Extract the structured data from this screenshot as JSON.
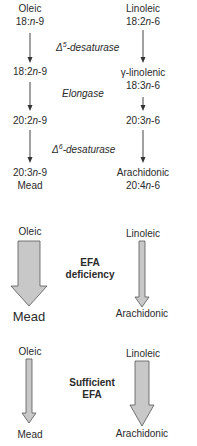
{
  "pathway": {
    "left": {
      "start_name": "Oleic",
      "start_formula_a": "18:",
      "start_formula_n": "n",
      "start_formula_b": "-9",
      "mid1_a": "18:2",
      "mid1_n": "n",
      "mid1_b": "-9",
      "mid2_a": "20:2",
      "mid2_n": "n",
      "mid2_b": "-9",
      "end_formula_a": "20:3",
      "end_formula_n": "n",
      "end_formula_b": "-9",
      "end_name": "Mead"
    },
    "right": {
      "start_name": "Linoleic",
      "start_formula_a": "18:2",
      "start_formula_n": "n",
      "start_formula_b": "-6",
      "mid1_name": "γ-linolenic",
      "mid1_a": "18:3",
      "mid1_n": "n",
      "mid1_b": "-6",
      "mid2_a": "20:3",
      "mid2_n": "n",
      "mid2_b": "-6",
      "end_name": "Arachidonic",
      "end_formula_a": "20:4",
      "end_formula_n": "n",
      "end_formula_b": "-6"
    },
    "enzymes": {
      "step1_delta": "Δ",
      "step1_sup": "5",
      "step1_text": "-desaturase",
      "step2": "Elongase",
      "step3_delta": "Δ",
      "step3_sup": "6",
      "step3_text": "-desaturase"
    }
  },
  "efa_deficiency": {
    "label_line1": "EFA",
    "label_line2": "deficiency",
    "left_start": "Oleic",
    "left_end": "Mead",
    "right_start": "Linoleic",
    "right_end": "Arachidonic"
  },
  "sufficient_efa": {
    "label_line1": "Sufficient",
    "label_line2": "EFA",
    "left_start": "Oleic",
    "left_end": "Mead",
    "right_start": "Linoleic",
    "right_end": "Arachidonic"
  },
  "colors": {
    "arrow_fill": "#c8c8c8",
    "arrow_stroke": "#555555",
    "text": "#2a2a2a"
  }
}
